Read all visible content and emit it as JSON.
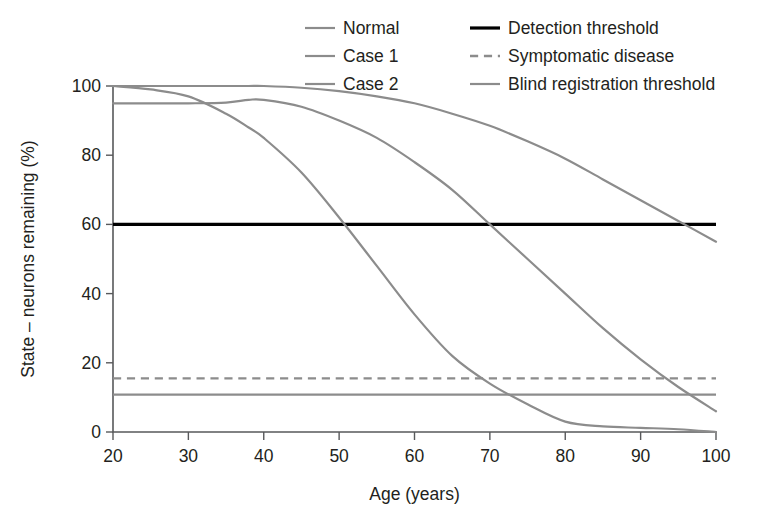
{
  "chart_data": {
    "type": "line",
    "title": "",
    "xlabel": "Age (years)",
    "ylabel": "State – neurons remaining (%)",
    "xlim": [
      20,
      100
    ],
    "ylim": [
      0,
      100
    ],
    "xticks": [
      20,
      30,
      40,
      50,
      60,
      70,
      80,
      90,
      100
    ],
    "yticks": [
      0,
      20,
      40,
      60,
      80,
      100
    ],
    "grid": false,
    "legend_position": "top-center",
    "x": [
      20,
      25,
      30,
      35,
      38,
      40,
      45,
      50,
      55,
      60,
      65,
      70,
      75,
      80,
      85,
      90,
      95,
      100
    ],
    "series": [
      {
        "name": "Normal",
        "color": "#8c8c8c",
        "style": "solid",
        "width": 2.2,
        "values": [
          100,
          100,
          100,
          100,
          100,
          100,
          99.5,
          98.5,
          97,
          95,
          92,
          88.5,
          84,
          79,
          73,
          67,
          61,
          55
        ]
      },
      {
        "name": "Case 1",
        "color": "#8c8c8c",
        "style": "solid",
        "width": 2.2,
        "values": [
          95,
          95,
          95,
          95.2,
          96,
          96,
          94,
          90,
          85,
          78,
          70,
          60,
          50,
          40,
          30,
          21,
          13,
          6
        ]
      },
      {
        "name": "Case 2",
        "color": "#8c8c8c",
        "style": "solid",
        "width": 2.2,
        "values": [
          100,
          99,
          97,
          92,
          88,
          85,
          75,
          62,
          48,
          34,
          22,
          14,
          8,
          3,
          1.6,
          1.2,
          0.8,
          0
        ]
      }
    ],
    "reference_lines": [
      {
        "name": "Detection threshold",
        "value": 60,
        "color": "#000000",
        "style": "solid",
        "width": 3.2
      },
      {
        "name": "Symptomatic disease",
        "value": 15.5,
        "color": "#8c8c8c",
        "style": "dashed",
        "width": 2.4
      },
      {
        "name": "Blind registration threshold",
        "value": 10.8,
        "color": "#8c8c8c",
        "style": "solid",
        "width": 2.2
      }
    ],
    "legend": [
      {
        "label": "Normal",
        "color": "#8c8c8c",
        "style": "solid",
        "width": 2.2,
        "col": 0,
        "row": 0
      },
      {
        "label": "Case 1",
        "color": "#8c8c8c",
        "style": "solid",
        "width": 2.2,
        "col": 0,
        "row": 1
      },
      {
        "label": "Case 2",
        "color": "#8c8c8c",
        "style": "solid",
        "width": 2.2,
        "col": 0,
        "row": 2
      },
      {
        "label": "Detection threshold",
        "color": "#000000",
        "style": "solid",
        "width": 3.2,
        "col": 1,
        "row": 0
      },
      {
        "label": "Symptomatic disease",
        "color": "#8c8c8c",
        "style": "dashed",
        "width": 2.4,
        "col": 1,
        "row": 1
      },
      {
        "label": "Blind registration threshold",
        "color": "#8c8c8c",
        "style": "solid",
        "width": 2.2,
        "col": 1,
        "row": 2
      }
    ]
  },
  "layout": {
    "plot": {
      "left": 113,
      "right": 716,
      "top": 86,
      "bottom": 432
    },
    "legend": {
      "col_x": [
        305,
        470
      ],
      "swatch_w": 30,
      "gap": 8,
      "row_y": [
        28,
        56,
        84
      ]
    }
  }
}
